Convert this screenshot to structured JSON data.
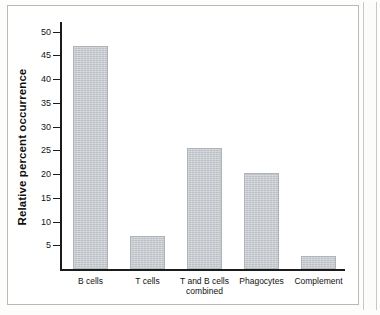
{
  "chart_data": {
    "type": "bar",
    "title": "",
    "xlabel": "",
    "ylabel": "Relative percent occurrence",
    "categories": [
      "B cells",
      "T cells",
      "T and B cells\ncombined",
      "Phagocytes",
      "Complement"
    ],
    "values": [
      47,
      7,
      25.5,
      20.3,
      2.7
    ],
    "yticks": [
      5,
      10,
      15,
      20,
      25,
      30,
      35,
      40,
      45,
      50
    ],
    "ylim": [
      0,
      52
    ],
    "grid": false,
    "legend": false,
    "bar_color": "#c4c9ce",
    "axis_color": "#1b1b1b"
  }
}
